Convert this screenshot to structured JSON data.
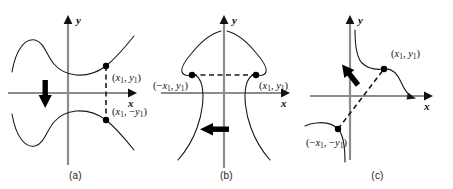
{
  "figure": {
    "background_color": "#ffffff",
    "axis_color": "#8c8c8c",
    "curve_color": "#1a1a1a",
    "dashed_color": "#1a1a1a",
    "arrow_color": "#000000",
    "point_color": "#000000"
  },
  "panels": [
    {
      "id": "a",
      "caption": "(a)",
      "symmetry": "x-axis",
      "axis": {
        "x_label": "x",
        "y_label": "y"
      },
      "points": [
        {
          "name": "upper-point",
          "label_plain": "(x1, y1)",
          "label_parts": {
            "open": "(",
            "x": "x",
            "xsub": "1",
            "comma": ", ",
            "y": "y",
            "ysub": "1",
            "close": ")",
            "x_sign": "",
            "y_sign": ""
          }
        },
        {
          "name": "lower-point",
          "label_plain": "(x1, -y1)",
          "label_parts": {
            "open": "(",
            "x": "x",
            "xsub": "1",
            "comma": ", ",
            "y": "y",
            "ysub": "1",
            "close": ")",
            "x_sign": "",
            "y_sign": "−"
          }
        }
      ],
      "reflection_arrow": {
        "direction": "down",
        "description": "thick downward block arrow"
      },
      "connector": {
        "style": "dashed",
        "orientation": "vertical"
      }
    },
    {
      "id": "b",
      "caption": "(b)",
      "symmetry": "y-axis",
      "axis": {
        "x_label": "x",
        "y_label": "y"
      },
      "points": [
        {
          "name": "left-point",
          "label_plain": "(-x1, y1)",
          "label_parts": {
            "open": "(",
            "x": "x",
            "xsub": "1",
            "comma": ", ",
            "y": "y",
            "ysub": "1",
            "close": ")",
            "x_sign": "−",
            "y_sign": ""
          }
        },
        {
          "name": "right-point",
          "label_plain": "(x1, y1)",
          "label_parts": {
            "open": "(",
            "x": "x",
            "xsub": "1",
            "comma": ", ",
            "y": "y",
            "ysub": "1",
            "close": ")",
            "x_sign": "",
            "y_sign": ""
          }
        }
      ],
      "reflection_arrow": {
        "direction": "left",
        "description": "thick leftward block arrow"
      },
      "connector": {
        "style": "dashed",
        "orientation": "horizontal"
      }
    },
    {
      "id": "c",
      "caption": "(c)",
      "symmetry": "origin",
      "axis": {
        "x_label": "x",
        "y_label": "y"
      },
      "points": [
        {
          "name": "upper-right-point",
          "label_plain": "(x1, y1)",
          "label_parts": {
            "open": "(",
            "x": "x",
            "xsub": "1",
            "comma": ", ",
            "y": "y",
            "ysub": "1",
            "close": ")",
            "x_sign": "",
            "y_sign": ""
          }
        },
        {
          "name": "lower-left-point",
          "label_plain": "(-x1, -y1)",
          "label_parts": {
            "open": "(",
            "x": "x",
            "xsub": "1",
            "comma": ", ",
            "y": "y",
            "ysub": "1",
            "close": ")",
            "x_sign": "−",
            "y_sign": "−"
          }
        }
      ],
      "reflection_arrow": {
        "direction": "down-left",
        "description": "thick diagonal block arrow toward lower-left"
      },
      "connector": {
        "style": "dashed",
        "orientation": "diagonal"
      }
    }
  ]
}
